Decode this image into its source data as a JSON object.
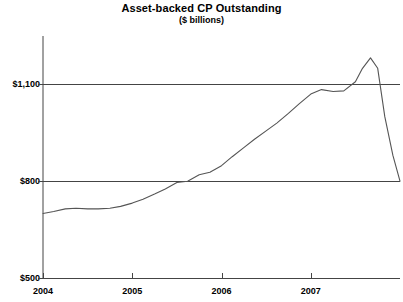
{
  "chart_data": {
    "type": "line",
    "title": "Asset-backed CP Outstanding",
    "subtitle": "($ billions)",
    "xlabel": "",
    "ylabel": "",
    "grid": true,
    "legend": false,
    "ylim": [
      500,
      1250
    ],
    "yticks": [
      500,
      800,
      1100
    ],
    "ytick_labels": [
      "$500",
      "$800",
      "$1,100"
    ],
    "xlim": [
      2004.0,
      2008.0
    ],
    "xticks": [
      2004,
      2005,
      2006,
      2007
    ],
    "xtick_labels": [
      "2004",
      "2005",
      "2006",
      "2007"
    ],
    "line_color": "#555555",
    "axis_color": "#000000",
    "series": [
      {
        "name": "Asset-backed CP Outstanding",
        "x": [
          2004.0,
          2004.12,
          2004.25,
          2004.37,
          2004.5,
          2004.62,
          2004.75,
          2004.87,
          2005.0,
          2005.12,
          2005.25,
          2005.37,
          2005.5,
          2005.62,
          2005.75,
          2005.87,
          2006.0,
          2006.12,
          2006.25,
          2006.37,
          2006.5,
          2006.62,
          2006.75,
          2006.87,
          2007.0,
          2007.12,
          2007.25,
          2007.37,
          2007.5,
          2007.58,
          2007.67,
          2007.75,
          2007.83,
          2007.92,
          2008.0
        ],
        "y": [
          700,
          706,
          714,
          716,
          714,
          714,
          716,
          722,
          732,
          744,
          760,
          776,
          796,
          800,
          820,
          828,
          848,
          876,
          904,
          930,
          956,
          980,
          1010,
          1040,
          1070,
          1084,
          1078,
          1080,
          1108,
          1150,
          1182,
          1150,
          1000,
          880,
          800
        ]
      }
    ]
  },
  "axes": {
    "plot_left_px": 43,
    "plot_right_px": 400,
    "plot_top_px": 36,
    "plot_bottom_px": 278
  }
}
